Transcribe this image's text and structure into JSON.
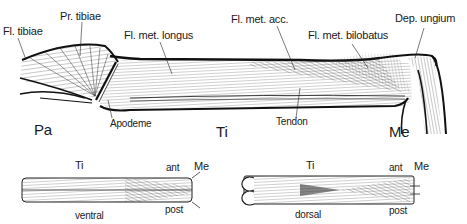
{
  "figure": {
    "main_view": {
      "segments": {
        "patella": "Pa",
        "tibia": "Ti",
        "metatarsus": "Me"
      },
      "muscle_labels": [
        {
          "id": "fl_tibiae",
          "text": "Fl. tibiae"
        },
        {
          "id": "pr_tibiae",
          "text": "Pr. tibiae"
        },
        {
          "id": "fl_met_longus",
          "text": "Fl. met. longus"
        },
        {
          "id": "fl_met_acc",
          "text": "Fl. met. acc."
        },
        {
          "id": "fl_met_bilobatus",
          "text": "Fl. met. bilobatus"
        },
        {
          "id": "dep_ungium",
          "text": "Dep. ungium"
        }
      ],
      "structure_labels": [
        {
          "id": "apodeme",
          "text": "Apodeme"
        },
        {
          "id": "tendon",
          "text": "Tendon"
        }
      ]
    },
    "ventral_view": {
      "segment_tibia": "Ti",
      "segment_metatarsus": "Me",
      "anterior": "ant",
      "posterior": "post",
      "view_label": "ventral"
    },
    "dorsal_view": {
      "segment_tibia": "Ti",
      "segment_metatarsus": "Me",
      "anterior": "ant",
      "posterior": "post",
      "view_label": "dorsal"
    },
    "colors": {
      "ink": "#1a1a1a",
      "background": "#ffffff",
      "hatch": "#555555"
    }
  }
}
